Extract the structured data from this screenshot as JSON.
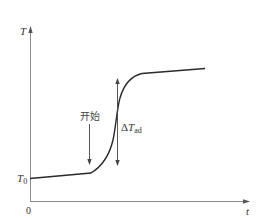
{
  "diagram": {
    "type": "temperature-time curve (adiabatic temperature rise)",
    "y_axis": {
      "label": "T"
    },
    "x_axis": {
      "label": "t"
    },
    "origin_label": "0",
    "initial_temperature_label": {
      "main": "T",
      "subscript": "0"
    },
    "start_annotation": {
      "label": "开始"
    },
    "delta_annotation": {
      "prefix": "Δ",
      "main": "T",
      "subscript": "ad"
    },
    "colors": {
      "axis": "#8a8a8a",
      "curve": "#2a2a2a",
      "annotation": "#444444",
      "text": "#333333"
    }
  }
}
